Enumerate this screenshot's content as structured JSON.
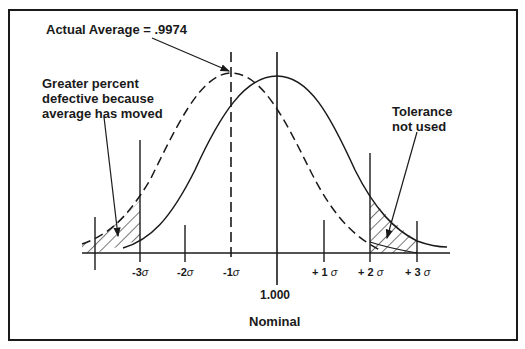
{
  "annotations": {
    "actual_average": "Actual Average = .9974",
    "greater_defective": [
      "Greater percent",
      "defective because",
      "average has moved"
    ],
    "tolerance_not_used": [
      "Tolerance",
      "not used"
    ]
  },
  "axis": {
    "ticks": [
      {
        "label": "-3",
        "sigma": "σ"
      },
      {
        "label": "-2",
        "sigma": "σ"
      },
      {
        "label": "-1",
        "sigma": "σ"
      },
      {
        "label": "+ 1",
        "sigma": "σ"
      },
      {
        "label": "+ 2",
        "sigma": "σ"
      },
      {
        "label": "+ 3",
        "sigma": "σ"
      }
    ],
    "nominal_value": "1.000",
    "nominal_label": "Nominal"
  },
  "curves": {
    "actual": {
      "style": "dashed",
      "mean_sigma": -1
    },
    "nominal": {
      "style": "solid",
      "mean_sigma": 0
    }
  },
  "colors": {
    "ink": "#1a1a1a",
    "background": "#ffffff"
  }
}
